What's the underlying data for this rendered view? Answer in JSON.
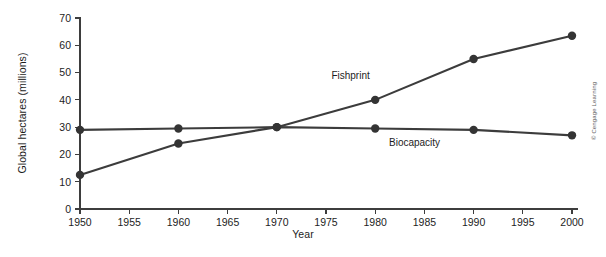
{
  "chart_data": {
    "type": "line",
    "title": "",
    "xlabel": "Year",
    "ylabel": "Global hectares (millions)",
    "x": [
      1950,
      1960,
      1970,
      1980,
      1990,
      2000
    ],
    "xlim": [
      1950,
      2000
    ],
    "ylim": [
      0,
      70
    ],
    "xticks": [
      "1950",
      "1955",
      "1960",
      "1965",
      "1970",
      "1975",
      "1980",
      "1985",
      "1990",
      "1995",
      "2000"
    ],
    "xtick_values": [
      1950,
      1955,
      1960,
      1965,
      1970,
      1975,
      1980,
      1985,
      1990,
      1995,
      2000
    ],
    "yticks": [
      "0",
      "10",
      "20",
      "30",
      "40",
      "50",
      "60",
      "70"
    ],
    "ytick_values": [
      0,
      10,
      20,
      30,
      40,
      50,
      60,
      70
    ],
    "grid": false,
    "legend_position": "inline-labels",
    "series": [
      {
        "name": "Fishprint",
        "values": [
          12.5,
          24,
          30,
          40,
          55,
          63.5
        ],
        "color": "#3c3c3c",
        "marker": "circle",
        "label_x": 1977.5,
        "label_y": 47.5
      },
      {
        "name": "Biocapacity",
        "values": [
          29,
          29.5,
          30,
          29.5,
          29,
          27
        ],
        "color": "#3c3c3c",
        "marker": "circle",
        "label_x": 1984.0,
        "label_y": 23.0
      }
    ],
    "annotations": []
  },
  "credit": {
    "text": "© Cengage Learning"
  },
  "colors": {
    "background": "#ffffff",
    "axis": "#3d3d3d",
    "line": "#3c3c3c",
    "marker": "#343434",
    "text": "#1d1d1d"
  }
}
